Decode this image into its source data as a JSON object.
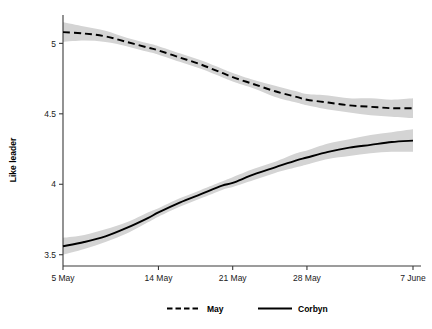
{
  "chart_data": {
    "type": "line",
    "title": "",
    "xlabel": "",
    "ylabel": "Like leader",
    "ylim": [
      3.42,
      5.18
    ],
    "yticks": [
      3.5,
      4,
      4.5,
      5
    ],
    "ytick_labels": [
      "3.5",
      "4",
      "4.5",
      "5"
    ],
    "xlim": [
      0,
      33
    ],
    "xticks": [
      0,
      9,
      16,
      23,
      33
    ],
    "xtick_labels": [
      "5 May",
      "14 May",
      "21 May",
      "28 May",
      "7 June"
    ],
    "grid": false,
    "legend_position": "bottom",
    "band_description": "95% confidence interval shaded grey",
    "series": [
      {
        "name": "May",
        "style": "dashed",
        "color": "#000000",
        "x": [
          0,
          2,
          4,
          6,
          8,
          9,
          11,
          13,
          15,
          16,
          18,
          20,
          22,
          23,
          25,
          27,
          29,
          31,
          33
        ],
        "values": [
          5.08,
          5.07,
          5.05,
          5.01,
          4.97,
          4.95,
          4.9,
          4.85,
          4.79,
          4.76,
          4.71,
          4.66,
          4.62,
          4.6,
          4.58,
          4.56,
          4.55,
          4.54,
          4.54
        ],
        "lower": [
          5.01,
          5.02,
          5.01,
          4.98,
          4.94,
          4.92,
          4.87,
          4.82,
          4.76,
          4.73,
          4.68,
          4.62,
          4.58,
          4.56,
          4.53,
          4.51,
          4.49,
          4.48,
          4.47
        ],
        "upper": [
          5.15,
          5.12,
          5.09,
          5.04,
          5.0,
          4.98,
          4.93,
          4.88,
          4.82,
          4.79,
          4.74,
          4.7,
          4.66,
          4.64,
          4.63,
          4.61,
          4.61,
          4.6,
          4.61
        ]
      },
      {
        "name": "Corbyn",
        "style": "solid",
        "color": "#000000",
        "x": [
          0,
          2,
          4,
          6,
          8,
          9,
          11,
          13,
          15,
          16,
          18,
          20,
          22,
          23,
          25,
          27,
          29,
          31,
          33
        ],
        "values": [
          3.56,
          3.59,
          3.63,
          3.69,
          3.76,
          3.8,
          3.87,
          3.93,
          3.99,
          4.01,
          4.07,
          4.12,
          4.17,
          4.19,
          4.23,
          4.26,
          4.28,
          4.3,
          4.31
        ],
        "lower": [
          3.5,
          3.54,
          3.59,
          3.65,
          3.73,
          3.77,
          3.84,
          3.9,
          3.96,
          3.98,
          4.03,
          4.08,
          4.12,
          4.14,
          4.18,
          4.2,
          4.22,
          4.23,
          4.23
        ],
        "upper": [
          3.62,
          3.64,
          3.68,
          3.73,
          3.8,
          3.83,
          3.9,
          3.96,
          4.02,
          4.05,
          4.11,
          4.16,
          4.22,
          4.24,
          4.29,
          4.32,
          4.35,
          4.37,
          4.39
        ]
      }
    ]
  },
  "legend": {
    "items": [
      {
        "label": "May",
        "style": "dashed"
      },
      {
        "label": "Corbyn",
        "style": "solid"
      }
    ]
  },
  "colors": {
    "line": "#000000",
    "band": "#d4d4d4",
    "axis": "#3a3a3a",
    "background": "#ffffff"
  }
}
